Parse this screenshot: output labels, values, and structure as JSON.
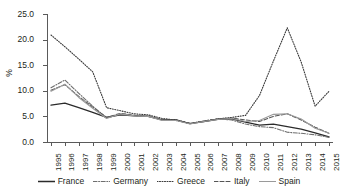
{
  "chart_data": {
    "type": "line",
    "title": "",
    "subtitle": "",
    "xlabel": "",
    "ylabel": "%",
    "xlim": [
      1995,
      2015
    ],
    "ylim": [
      0.0,
      25.0
    ],
    "ytick_step": 5.0,
    "grid": false,
    "legend_position": "bottom",
    "x": [
      1995,
      1996,
      1997,
      1998,
      1999,
      2000,
      2001,
      2002,
      2003,
      2004,
      2005,
      2006,
      2007,
      2008,
      2009,
      2010,
      2011,
      2012,
      2013,
      2014,
      2015
    ],
    "categories": [
      "1995",
      "1996",
      "1997",
      "1998",
      "1999",
      "2000",
      "2001",
      "2002",
      "2003",
      "2004",
      "2005",
      "2006",
      "2007",
      "2008",
      "2009",
      "2010",
      "2011",
      "2012",
      "2013",
      "2014",
      "2015"
    ],
    "ytick_labels": [
      "0.0",
      "5.0",
      "10.0",
      "15.0",
      "20.0",
      "25.0"
    ],
    "ytick_values": [
      0.0,
      5.0,
      10.0,
      15.0,
      20.0,
      25.0
    ],
    "series": [
      {
        "name": "France",
        "style": "solid",
        "color": "#2b2b2b",
        "values": [
          7.2,
          7.6,
          6.7,
          5.8,
          4.8,
          5.3,
          5.1,
          5.0,
          4.3,
          4.3,
          3.6,
          4.0,
          4.4,
          4.5,
          3.9,
          3.3,
          3.5,
          3.0,
          2.5,
          1.8,
          1.0
        ]
      },
      {
        "name": "Germany",
        "style": "dash-dot",
        "color": "#6e6e6e",
        "values": [
          10.6,
          12.1,
          9.5,
          7.0,
          4.7,
          5.4,
          5.2,
          5.1,
          4.3,
          4.2,
          3.6,
          4.0,
          4.5,
          4.3,
          3.5,
          3.0,
          2.8,
          1.9,
          1.7,
          1.4,
          0.9
        ]
      },
      {
        "name": "Greece",
        "style": "dotted",
        "color": "#3a3a3a",
        "values": [
          20.9,
          18.6,
          16.2,
          13.7,
          6.7,
          6.1,
          5.5,
          5.3,
          4.6,
          4.3,
          3.6,
          4.1,
          4.5,
          4.8,
          5.2,
          9.1,
          15.8,
          22.3,
          15.6,
          7.0,
          9.9
        ]
      },
      {
        "name": "Italy",
        "style": "dashed",
        "color": "#555555",
        "values": [
          10.1,
          11.2,
          8.9,
          6.8,
          4.8,
          5.6,
          5.2,
          5.0,
          4.3,
          4.3,
          3.6,
          4.1,
          4.5,
          4.7,
          4.3,
          4.0,
          5.0,
          5.5,
          4.3,
          2.9,
          1.7
        ]
      },
      {
        "name": "Spain",
        "style": "solid-light",
        "color": "#9a9a9a",
        "values": [
          9.9,
          11.3,
          8.7,
          6.6,
          4.6,
          5.5,
          5.1,
          5.0,
          4.2,
          4.2,
          3.5,
          4.0,
          4.4,
          4.6,
          4.0,
          4.2,
          5.4,
          5.5,
          4.5,
          2.7,
          1.7
        ]
      }
    ]
  },
  "legend": {
    "items": [
      {
        "label": "France",
        "swatch": "solid-line-swatch"
      },
      {
        "label": "Germany",
        "swatch": "dash-dot-line-swatch"
      },
      {
        "label": "Greece",
        "swatch": "dotted-line-swatch"
      },
      {
        "label": "Italy",
        "swatch": "dashed-line-swatch"
      },
      {
        "label": "Spain",
        "swatch": "solid-light-line-swatch"
      }
    ]
  },
  "axes": {
    "y_title": "%"
  }
}
